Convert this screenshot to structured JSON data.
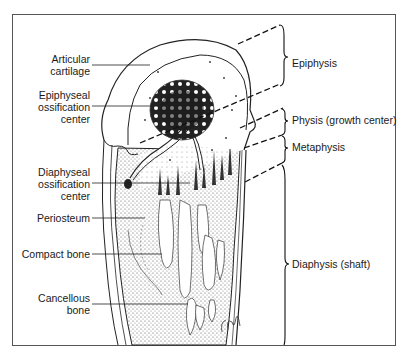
{
  "diagram": {
    "left_labels": [
      {
        "id": "articular-cartilage",
        "line1": "Articular",
        "line2": "cartilage",
        "line3": ""
      },
      {
        "id": "epiphyseal-ossification-center",
        "line1": "Epiphyseal",
        "line2": "ossification",
        "line3": "center"
      },
      {
        "id": "diaphyseal-ossification-center",
        "line1": "Diaphyseal",
        "line2": "ossification",
        "line3": "center"
      },
      {
        "id": "periosteum",
        "line1": "Periosteum",
        "line2": "",
        "line3": ""
      },
      {
        "id": "compact-bone",
        "line1": "Compact bone",
        "line2": "",
        "line3": ""
      },
      {
        "id": "cancellous-bone",
        "line1": "Cancellous",
        "line2": "bone",
        "line3": ""
      }
    ],
    "right_labels": [
      {
        "id": "epiphysis",
        "text": "Epiphysis"
      },
      {
        "id": "physis",
        "text": "Physis (growth center)"
      },
      {
        "id": "metaphysis",
        "text": "Metaphysis"
      },
      {
        "id": "diaphysis",
        "text": "Diaphysis (shaft)"
      }
    ],
    "signature": "artist signature"
  }
}
